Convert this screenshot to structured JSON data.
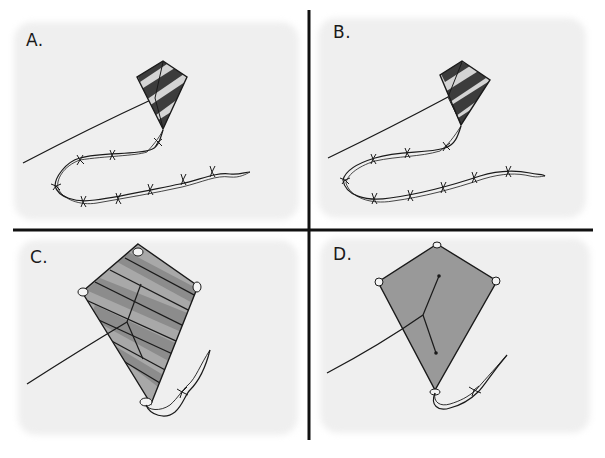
{
  "figure": {
    "panels": [
      {
        "label": "A.",
        "kite": "small kite with dark/light diagonal stripes",
        "tail": "long tail with many bows"
      },
      {
        "label": "B.",
        "kite": "small kite with dark/light diagonal stripes",
        "tail": "long tail with many bows"
      },
      {
        "label": "C.",
        "kite": "large kite with gray diagonal stripes",
        "tail": "short ribbon tail with one bow"
      },
      {
        "label": "D.",
        "kite": "large plain gray kite",
        "tail": "short ribbon tail with one bow"
      }
    ]
  },
  "colors": {
    "background": "#ffffff",
    "panel_bg": "#efefef",
    "ink": "#1a1a1a",
    "dark_stripe": "#3c3c3c",
    "light_stripe": "#d4d4d4",
    "gray_stripe_dark": "#8c8c8c",
    "gray_stripe_light": "#a8a8a8",
    "plain_gray": "#999999"
  }
}
